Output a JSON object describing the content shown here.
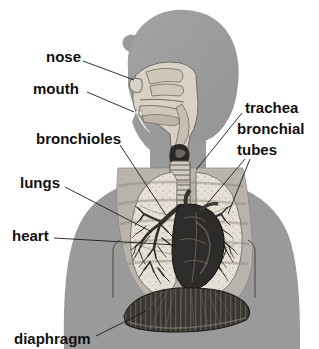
{
  "diagram": {
    "background_color": "#ffffff",
    "body_silhouette_color": "#9a9a9a",
    "cavity_color": "#b9b4ae",
    "airway_color": "#d8d2c6",
    "lung_color": "#e8e4dc",
    "heart_color": "#2e2c2a",
    "diaphragm_color": "#3a3733",
    "leader_color": "#1a1a1a",
    "label_color": "#111111"
  },
  "labels": [
    {
      "id": "nose",
      "text": "nose",
      "side": "left",
      "text_x": 46,
      "text_y": 58,
      "anchor": "start",
      "leaders": [
        [
          83,
          61,
          134,
          80
        ]
      ]
    },
    {
      "id": "mouth",
      "text": "mouth",
      "side": "left",
      "text_x": 33,
      "text_y": 90,
      "anchor": "start",
      "leaders": [
        [
          87,
          92,
          134,
          112
        ]
      ]
    },
    {
      "id": "bronchioles",
      "text": "bronchioles",
      "side": "left",
      "text_x": 36,
      "text_y": 140,
      "anchor": "start",
      "leaders": [
        [
          120,
          145,
          166,
          215
        ]
      ]
    },
    {
      "id": "lungs",
      "text": "lungs",
      "side": "left",
      "text_x": 20,
      "text_y": 184,
      "anchor": "start",
      "leaders": [
        [
          65,
          187,
          152,
          232
        ]
      ]
    },
    {
      "id": "heart",
      "text": "heart",
      "side": "left",
      "text_x": 12,
      "text_y": 237,
      "anchor": "start",
      "leaders": [
        [
          54,
          238,
          176,
          245
        ]
      ]
    },
    {
      "id": "diaphragm",
      "text": "diaphragm",
      "side": "left",
      "text_x": 14,
      "text_y": 340,
      "anchor": "start",
      "leaders": [
        [
          96,
          336,
          148,
          310
        ]
      ]
    },
    {
      "id": "trachea",
      "text": "trachea",
      "side": "right",
      "text_x": 245,
      "text_y": 109,
      "anchor": "start",
      "leaders": [
        [
          242,
          113,
          196,
          170
        ]
      ]
    },
    {
      "id": "bronchial",
      "text": "bronchial",
      "side": "right",
      "text_x": 237,
      "text_y": 130,
      "anchor": "start",
      "leaders": []
    },
    {
      "id": "tubes",
      "text": "tubes",
      "side": "right",
      "text_x": 237,
      "text_y": 151,
      "anchor": "start",
      "leaders": [
        [
          245,
          159,
          206,
          205
        ],
        [
          250,
          159,
          228,
          214
        ]
      ]
    }
  ]
}
